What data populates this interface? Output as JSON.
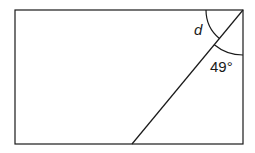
{
  "diagram": {
    "type": "geometry",
    "shape": "rectangle",
    "rectangle": {
      "x": 15,
      "y": 10,
      "width": 228,
      "height": 134
    },
    "diagonal": {
      "x1": 243,
      "y1": 10,
      "x2": 132,
      "y2": 144
    },
    "angles": [
      {
        "label": "d",
        "style": "italic",
        "between": [
          "top-edge",
          "diagonal"
        ]
      },
      {
        "label": "49°",
        "style": "normal",
        "between": [
          "diagonal",
          "right-edge"
        ]
      }
    ],
    "colors": {
      "stroke": "#1a1a1a",
      "background": "#ffffff"
    }
  }
}
